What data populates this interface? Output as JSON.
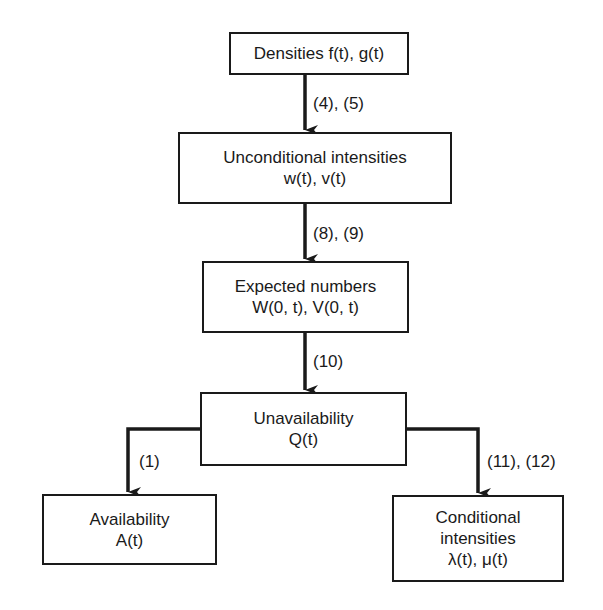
{
  "diagram": {
    "type": "flowchart",
    "nodes": [
      {
        "id": "densities",
        "lines": [
          "Densities f(t), g(t)"
        ]
      },
      {
        "id": "unconditional",
        "lines": [
          "Unconditional intensities",
          "w(t), v(t)"
        ]
      },
      {
        "id": "expected",
        "lines": [
          "Expected numbers",
          "W(0, t), V(0, t)"
        ]
      },
      {
        "id": "unavailability",
        "lines": [
          "Unavailability",
          "Q(t)"
        ]
      },
      {
        "id": "availability",
        "lines": [
          "Availability",
          "A(t)"
        ]
      },
      {
        "id": "conditional",
        "lines": [
          "Conditional",
          "intensities",
          "λ(t), μ(t)"
        ]
      }
    ],
    "edges": [
      {
        "from": "densities",
        "to": "unconditional",
        "label": "(4), (5)"
      },
      {
        "from": "unconditional",
        "to": "expected",
        "label": "(8), (9)"
      },
      {
        "from": "expected",
        "to": "unavailability",
        "label": "(10)"
      },
      {
        "from": "unavailability",
        "to": "availability",
        "label": "(1)"
      },
      {
        "from": "unavailability",
        "to": "conditional",
        "label": "(11), (12)"
      }
    ]
  }
}
